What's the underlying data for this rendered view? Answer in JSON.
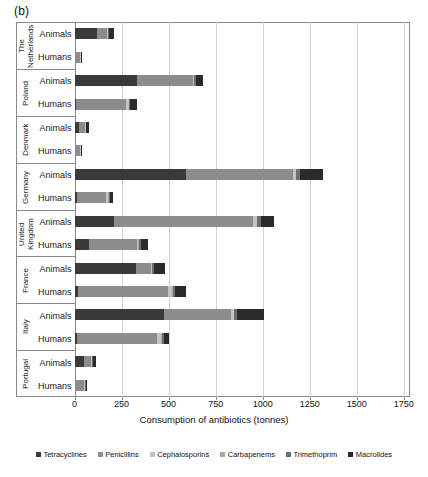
{
  "panel_label": "(b)",
  "axis": {
    "xlabel": "Consumption of antibiotics (tonnes)",
    "ticks": [
      0,
      250,
      500,
      750,
      1000,
      1250,
      1500,
      1750
    ],
    "tick_labels": [
      "0",
      "250",
      "500",
      "750",
      "1000",
      "1250",
      "1500",
      "1750"
    ],
    "xmin": 0,
    "xmax": 1780
  },
  "legend": {
    "items": [
      {
        "label": "Tetracyclines",
        "color": "#3a3a3a"
      },
      {
        "label": "Penicillins",
        "color": "#8c8c8c"
      },
      {
        "label": "Cephalosporins",
        "color": "#c3c3c3"
      },
      {
        "label": "Carbapenems",
        "color": "#a8a8a8"
      },
      {
        "label": "Trimethoprim",
        "color": "#6e6e6e"
      },
      {
        "label": "Macrolides",
        "color": "#2b2b2b"
      }
    ]
  },
  "row_labels": {
    "animals": "Animals",
    "humans": "Humans"
  },
  "chart_data": {
    "type": "bar",
    "orientation": "horizontal",
    "stacked": true,
    "title": "",
    "xlabel": "Consumption of antibiotics (tonnes)",
    "ylabel": "",
    "xlim": [
      0,
      1780
    ],
    "grid": "vertical",
    "legend_position": "bottom",
    "series": [
      {
        "name": "Tetracyclines",
        "color": "#3a3a3a"
      },
      {
        "name": "Penicillins",
        "color": "#8c8c8c"
      },
      {
        "name": "Cephalosporins",
        "color": "#c3c3c3"
      },
      {
        "name": "Carbapenems",
        "color": "#a8a8a8"
      },
      {
        "name": "Trimethoprim",
        "color": "#6e6e6e"
      },
      {
        "name": "Macrolides",
        "color": "#2b2b2b"
      }
    ],
    "countries": [
      {
        "name": "The Netherlands",
        "name_display": "The\nNetherlands",
        "rows": [
          {
            "group": "Animals",
            "values": {
              "Tetracyclines": 118,
              "Penicillins": 55,
              "Cephalosporins": 4,
              "Carbapenems": 0,
              "Trimethoprim": 5,
              "Macrolides": 28
            },
            "total": 210
          },
          {
            "group": "Humans",
            "values": {
              "Tetracyclines": 2,
              "Penicillins": 28,
              "Cephalosporins": 2,
              "Carbapenems": 0,
              "Trimethoprim": 3,
              "Macrolides": 5
            },
            "total": 40
          }
        ]
      },
      {
        "name": "Poland",
        "name_display": "Poland",
        "rows": [
          {
            "group": "Animals",
            "values": {
              "Tetracyclines": 330,
              "Penicillins": 300,
              "Cephalosporins": 5,
              "Carbapenems": 0,
              "Trimethoprim": 8,
              "Macrolides": 42
            },
            "total": 685
          },
          {
            "group": "Humans",
            "values": {
              "Tetracyclines": 10,
              "Penicillins": 265,
              "Cephalosporins": 12,
              "Carbapenems": 1,
              "Trimethoprim": 6,
              "Macrolides": 36
            },
            "total": 330
          }
        ]
      },
      {
        "name": "Denmark",
        "name_display": "Denmark",
        "rows": [
          {
            "group": "Animals",
            "values": {
              "Tetracyclines": 24,
              "Penicillins": 34,
              "Cephalosporins": 1,
              "Carbapenems": 0,
              "Trimethoprim": 3,
              "Macrolides": 15
            },
            "total": 77
          },
          {
            "group": "Humans",
            "values": {
              "Tetracyclines": 3,
              "Penicillins": 28,
              "Cephalosporins": 1,
              "Carbapenems": 0,
              "Trimethoprim": 2,
              "Macrolides": 6
            },
            "total": 40
          }
        ]
      },
      {
        "name": "Germany",
        "name_display": "Germany",
        "rows": [
          {
            "group": "Animals",
            "values": {
              "Tetracyclines": 595,
              "Penicillins": 565,
              "Cephalosporins": 15,
              "Carbapenems": 0,
              "Trimethoprim": 25,
              "Macrolides": 120
            },
            "total": 1320
          },
          {
            "group": "Humans",
            "values": {
              "Tetracyclines": 12,
              "Penicillins": 155,
              "Cephalosporins": 12,
              "Carbapenems": 2,
              "Trimethoprim": 9,
              "Macrolides": 15
            },
            "total": 205
          }
        ]
      },
      {
        "name": "United Kingdom",
        "name_display": "United\nKingdom",
        "rows": [
          {
            "group": "Animals",
            "values": {
              "Tetracyclines": 210,
              "Penicillins": 740,
              "Cephalosporins": 18,
              "Carbapenems": 0,
              "Trimethoprim": 22,
              "Macrolides": 70
            },
            "total": 1060
          },
          {
            "group": "Humans",
            "values": {
              "Tetracyclines": 75,
              "Penicillins": 255,
              "Cephalosporins": 10,
              "Carbapenems": 2,
              "Trimethoprim": 12,
              "Macrolides": 35
            },
            "total": 389
          }
        ]
      },
      {
        "name": "France",
        "name_display": "France",
        "rows": [
          {
            "group": "Animals",
            "values": {
              "Tetracyclines": 328,
              "Penicillins": 80,
              "Cephalosporins": 5,
              "Carbapenems": 0,
              "Trimethoprim": 12,
              "Macrolides": 58
            },
            "total": 483
          },
          {
            "group": "Humans",
            "values": {
              "Tetracyclines": 18,
              "Penicillins": 480,
              "Cephalosporins": 22,
              "Carbapenems": 3,
              "Trimethoprim": 10,
              "Macrolides": 57
            },
            "total": 590
          }
        ]
      },
      {
        "name": "Italy",
        "name_display": "Italy",
        "rows": [
          {
            "group": "Animals",
            "values": {
              "Tetracyclines": 478,
              "Penicillins": 355,
              "Cephalosporins": 12,
              "Carbapenems": 0,
              "Trimethoprim": 18,
              "Macrolides": 142
            },
            "total": 1005
          },
          {
            "group": "Humans",
            "values": {
              "Tetracyclines": 15,
              "Penicillins": 425,
              "Cephalosporins": 22,
              "Carbapenems": 4,
              "Trimethoprim": 8,
              "Macrolides": 30
            },
            "total": 504
          }
        ]
      },
      {
        "name": "Portugal",
        "name_display": "Portugal",
        "rows": [
          {
            "group": "Animals",
            "values": {
              "Tetracyclines": 48,
              "Penicillins": 42,
              "Cephalosporins": 2,
              "Carbapenems": 0,
              "Trimethoprim": 4,
              "Macrolides": 18
            },
            "total": 114
          },
          {
            "group": "Humans",
            "values": {
              "Tetracyclines": 4,
              "Penicillins": 48,
              "Cephalosporins": 4,
              "Carbapenems": 1,
              "Trimethoprim": 2,
              "Macrolides": 9
            },
            "total": 68
          }
        ]
      }
    ]
  }
}
